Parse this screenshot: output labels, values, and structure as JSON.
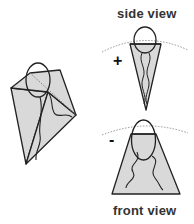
{
  "labels": {
    "side_view": "side view",
    "front_view": "front view"
  },
  "signs": {
    "side": "+",
    "front": "-"
  },
  "colors": {
    "fill": "#d9d9d9",
    "stroke": "#222222",
    "dotted": "#888888",
    "text": "#333333"
  },
  "figures": [
    {
      "name": "3d-pyramid-view",
      "description": "oblique view of inverted pyramid with ellipse (head) and wavy tail lines"
    },
    {
      "name": "side-view",
      "description": "narrow inverted triangle with ellipse and crossing lines, marked +"
    },
    {
      "name": "front-view",
      "description": "trapezoid with ellipse and two wavy lines, marked -"
    }
  ]
}
